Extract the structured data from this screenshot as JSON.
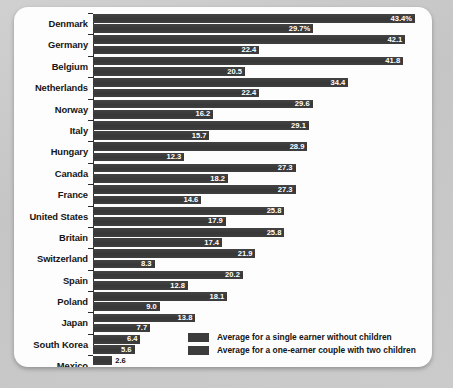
{
  "chart_data": {
    "type": "bar",
    "orientation": "horizontal",
    "title": "",
    "subtitle": "",
    "xlabel": "",
    "ylabel": "",
    "grid": false,
    "xlim": [
      0,
      43.4
    ],
    "legend_position": "bottom-right",
    "categories": [
      "Denmark",
      "Germany",
      "Belgium",
      "Netherlands",
      "Norway",
      "Italy",
      "Hungary",
      "Canada",
      "France",
      "United States",
      "Britain",
      "Switzerland",
      "Spain",
      "Poland",
      "Japan",
      "South Korea",
      "Mexico"
    ],
    "series": [
      {
        "name": "Average for a single earner without children",
        "values": [
          43.4,
          42.1,
          41.8,
          34.4,
          29.6,
          29.1,
          28.9,
          27.3,
          27.3,
          25.8,
          25.8,
          21.9,
          20.2,
          18.1,
          13.8,
          6.4,
          2.6
        ],
        "labels": [
          "43.4%",
          "42.1",
          "41.8",
          "34.4",
          "29.6",
          "29.1",
          "28.9",
          "27.3",
          "27.3",
          "25.8",
          "25.8",
          "21.9",
          "20.2",
          "18.1",
          "13.8",
          "6.4",
          "2.6"
        ]
      },
      {
        "name": "Average for a one-earner couple with two children",
        "values": [
          29.7,
          22.4,
          20.5,
          22.4,
          16.2,
          15.7,
          12.3,
          18.2,
          14.6,
          17.9,
          17.4,
          8.3,
          12.8,
          9.0,
          7.7,
          5.6,
          2.6
        ],
        "labels": [
          "29.7%",
          "22.4",
          "20.5",
          "22.4",
          "16.2",
          "15.7",
          "12.3",
          "18.2",
          "14.6",
          "17.9",
          "17.4",
          "8.3",
          "12.8",
          "9.0",
          "7.7",
          "5.6",
          "2.6"
        ]
      }
    ],
    "colors": {
      "bar": "#3c3c3c",
      "card_background": "#fdfdfd",
      "page_background": "#c9c9c9",
      "label_text": "#161616",
      "value_text": "#ffffff"
    }
  },
  "legend": {
    "items": [
      {
        "label": "Average for a single earner without children",
        "color": "#3c3c3c"
      },
      {
        "label": "Average for a one-earner couple with two children",
        "color": "#3c3c3c"
      }
    ]
  }
}
